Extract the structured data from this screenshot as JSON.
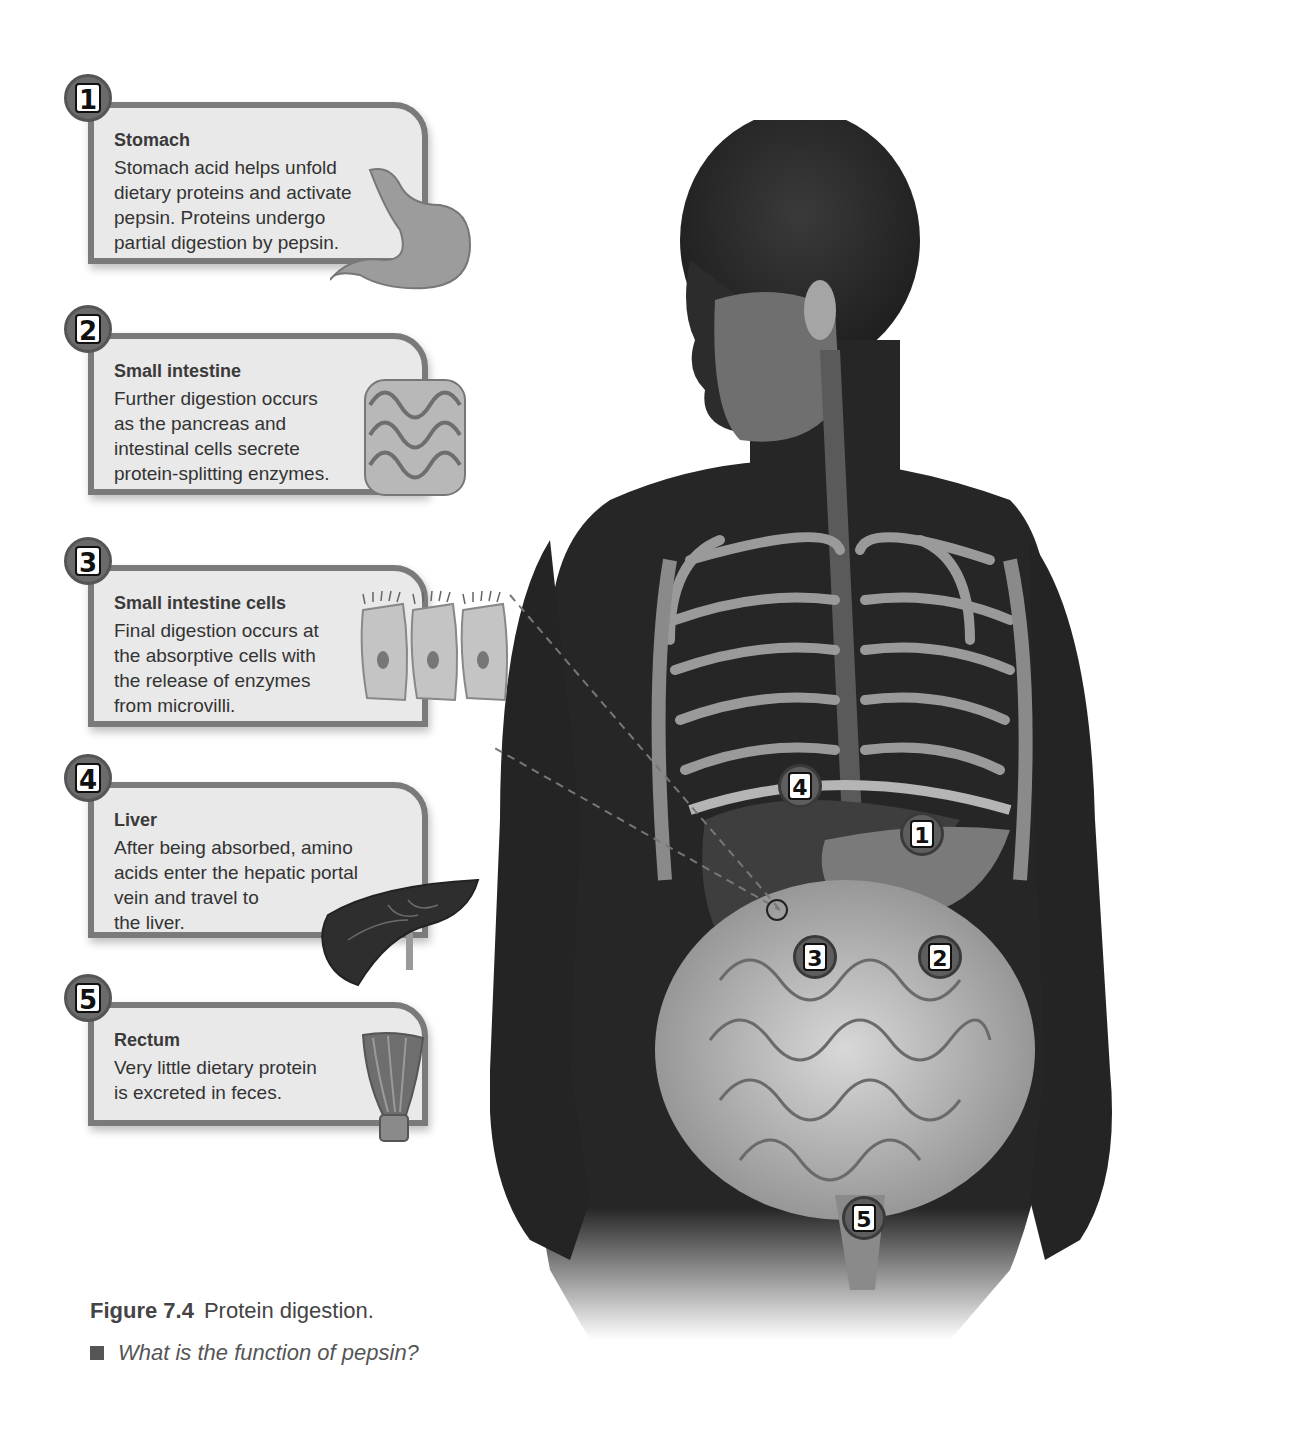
{
  "callouts": [
    {
      "number": "1",
      "title": "Stomach",
      "text": "Stomach acid helps unfold\ndietary proteins and activate\npepsin. Proteins undergo\npartial digestion by pepsin.",
      "icon": "stomach-icon"
    },
    {
      "number": "2",
      "title": "Small intestine",
      "text": "Further digestion occurs\nas the pancreas and\nintestinal cells secrete\nprotein-splitting enzymes.",
      "icon": "small-intestine-icon"
    },
    {
      "number": "3",
      "title": "Small intestine cells",
      "text": "Final digestion occurs at\nthe absorptive cells with\nthe release of enzymes\nfrom microvilli.",
      "icon": "absorptive-cells-icon"
    },
    {
      "number": "4",
      "title": "Liver",
      "text": "After being absorbed, amino\nacids enter the hepatic portal\nvein and travel to\nthe liver.",
      "icon": "liver-icon"
    },
    {
      "number": "5",
      "title": "Rectum",
      "text": "Very little dietary protein\nis excreted in feces.",
      "icon": "rectum-icon"
    }
  ],
  "body_markers": [
    {
      "number": "1",
      "organ": "stomach"
    },
    {
      "number": "2",
      "organ": "small intestine"
    },
    {
      "number": "3",
      "organ": "small intestine cells"
    },
    {
      "number": "4",
      "organ": "liver"
    },
    {
      "number": "5",
      "organ": "rectum"
    }
  ],
  "caption": {
    "figure_label": "Figure 7.4",
    "figure_title": "Protein digestion.",
    "question": "What is the function of pepsin?"
  },
  "colors": {
    "callout_bg": "#e9e9e9",
    "callout_border": "#7a7a7a",
    "body_skin": "#2a2a2a",
    "text": "#333333"
  }
}
